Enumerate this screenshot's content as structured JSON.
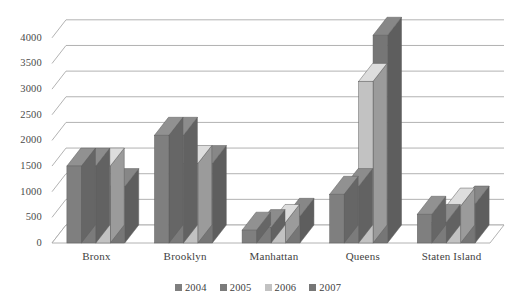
{
  "figure": {
    "title_fragment": "",
    "background": "#ffffff"
  },
  "chart_data": {
    "type": "bar",
    "title": "",
    "subtitle": "",
    "xlabel": "",
    "ylabel": "",
    "categories": [
      "Bronx",
      "Brooklyn",
      "Manhattan",
      "Queens",
      "Staten Island"
    ],
    "series": [
      {
        "name": "2004",
        "color": "#7f7f7f",
        "values": [
          1500,
          2100,
          250,
          950,
          560
        ]
      },
      {
        "name": "2005",
        "color": "#7b7b7b",
        "values": [
          1500,
          2100,
          300,
          1100,
          400
        ]
      },
      {
        "name": "2006",
        "color": "#c2c2c2",
        "values": [
          1500,
          1550,
          400,
          3150,
          720
        ]
      },
      {
        "name": "2007",
        "color": "#767676",
        "values": [
          1100,
          1550,
          520,
          4050,
          760
        ]
      }
    ],
    "ylim": [
      0,
      4250
    ],
    "ytick_values": [
      0,
      500,
      1000,
      1500,
      2000,
      2500,
      3000,
      3500,
      4000
    ],
    "ytick_labels": [
      "0",
      "500",
      "1000",
      "1500",
      "2000",
      "2500",
      "3000",
      "3500",
      "4000"
    ],
    "grid": true,
    "grid_axis": "y",
    "legend_position": "bottom",
    "three_d": true,
    "style": "grayscale-scanned"
  },
  "legend": {
    "items": [
      {
        "label": "2004",
        "color": "#7f7f7f"
      },
      {
        "label": "2005",
        "color": "#7b7b7b"
      },
      {
        "label": "2006",
        "color": "#c2c2c2"
      },
      {
        "label": "2007",
        "color": "#767676"
      }
    ]
  },
  "axes": {
    "y_tick_labels": [
      "4000",
      "3500",
      "3000",
      "2500",
      "2000",
      "1500",
      "1000",
      "500",
      "0"
    ],
    "x_tick_labels": [
      "Bronx",
      "Brooklyn",
      "Manhattan",
      "Queens",
      "Staten Island"
    ]
  }
}
